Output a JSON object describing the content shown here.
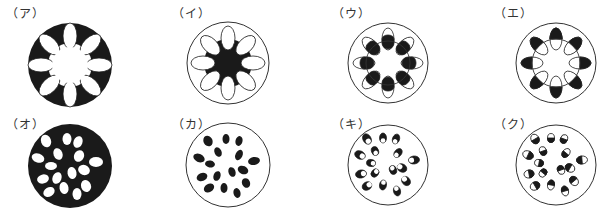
{
  "figure": {
    "colors": {
      "ink": "#1a1a1a",
      "paper": "#ffffff",
      "outline": "#333333"
    },
    "panels": [
      {
        "id": "a",
        "label": "（ア）",
        "type": "ring",
        "desc": "dark ground tissue, 8 white bundles in ring, white center"
      },
      {
        "id": "i",
        "label": "（イ）",
        "type": "ring",
        "desc": "white ground, dark center star, 8 white bundles in ring"
      },
      {
        "id": "u",
        "label": "（ウ）",
        "type": "ring",
        "desc": "8 bundles in ring, inner half dark (xylem inside) on inner circle"
      },
      {
        "id": "e",
        "label": "（エ）",
        "type": "ring",
        "desc": "8 bundles in ring, outer half dark on inner circle"
      },
      {
        "id": "o",
        "label": "（オ）",
        "type": "scattered",
        "desc": "dark ground tissue, scattered white bundles"
      },
      {
        "id": "ka",
        "label": "（カ）",
        "type": "scattered",
        "desc": "white ground, scattered dark bundles"
      },
      {
        "id": "ki",
        "label": "（キ）",
        "type": "scattered",
        "desc": "scattered bundles, mostly dark with white side toward center"
      },
      {
        "id": "ku",
        "label": "（ク）",
        "type": "scattered",
        "desc": "scattered bundles, mostly white with dark outer side"
      }
    ]
  }
}
